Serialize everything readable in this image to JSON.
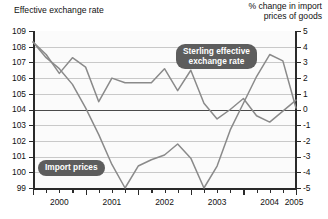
{
  "titles": {
    "left": "Effective exchange rate",
    "right": "% change in import\nprices of goods"
  },
  "callouts": {
    "sterling": "Sterling effective\nexchange rate",
    "import": "Import prices"
  },
  "axes": {
    "left_ticks": [
      "109",
      "108",
      "107",
      "106",
      "105",
      "104",
      "103",
      "102",
      "101",
      "100",
      "99"
    ],
    "right_ticks": [
      "5",
      "4",
      "3",
      "2",
      "1",
      "0",
      "-1",
      "-2",
      "-3",
      "-4",
      "-5"
    ],
    "x_ticks": [
      "2000",
      "2001",
      "2002",
      "2003",
      "2004",
      "2005"
    ]
  },
  "chart_data": {
    "type": "line",
    "title": "",
    "xlabel": "",
    "ylabel": "Effective exchange rate",
    "y2label": "% change in import prices of goods",
    "ylim": [
      99,
      109
    ],
    "y2lim": [
      -5,
      5
    ],
    "grid": true,
    "legend": "annotations",
    "x": [
      "2000Q1",
      "2000Q2",
      "2000Q3",
      "2000Q4",
      "2001Q1",
      "2001Q2",
      "2001Q3",
      "2001Q4",
      "2002Q1",
      "2002Q2",
      "2002Q3",
      "2002Q4",
      "2003Q1",
      "2003Q2",
      "2003Q3",
      "2003Q4",
      "2004Q1",
      "2004Q2",
      "2004Q3",
      "2004Q4",
      "2005Q1"
    ],
    "xlim": [
      2000.0,
      2005.0
    ],
    "series": [
      {
        "name": "Sterling effective exchange rate",
        "axis": "left",
        "color": "#8a8a8a",
        "values": [
          108.3,
          107.5,
          106.3,
          107.3,
          106.7,
          104.5,
          106.0,
          105.7,
          105.7,
          105.7,
          106.6,
          105.2,
          106.5,
          104.4,
          103.4,
          104.0,
          104.7,
          103.6,
          103.2,
          103.9,
          104.6
        ]
      },
      {
        "name": "Import prices",
        "axis": "right",
        "color": "#8a8a8a",
        "values": [
          4.3,
          3.3,
          2.6,
          1.6,
          0.1,
          -1.6,
          -3.5,
          -5.0,
          -3.6,
          -3.2,
          -2.9,
          -2.2,
          -3.1,
          -5.0,
          -3.6,
          -1.3,
          0.4,
          2.1,
          3.5,
          3.1,
          0.1
        ]
      }
    ]
  }
}
